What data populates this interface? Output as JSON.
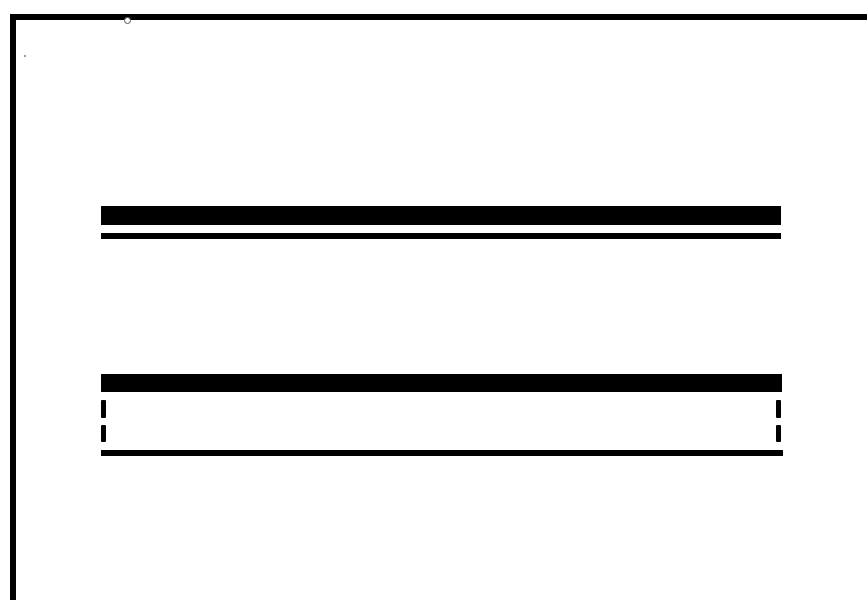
{
  "diagram": {
    "type": "line-symbol-legend",
    "colors": {
      "background": "#ffffff",
      "ink": "#000000"
    },
    "frame": {
      "top": {
        "x": 10,
        "y": 14,
        "w": 857,
        "h": 6
      },
      "left": {
        "x": 10,
        "y": 14,
        "w": 6,
        "h": 586
      }
    },
    "symbols": [
      {
        "name": "double-line-symbol",
        "parts": [
          {
            "role": "thick-bar",
            "x": 101,
            "y": 206,
            "w": 680,
            "h": 19
          },
          {
            "role": "thin-bar",
            "x": 101,
            "y": 233,
            "w": 680,
            "h": 6
          }
        ]
      },
      {
        "name": "box-with-dashed-sides-symbol",
        "parts": [
          {
            "role": "thick-bar",
            "x": 101,
            "y": 374,
            "w": 681,
            "h": 18
          },
          {
            "role": "left-dash-1",
            "x": 101,
            "y": 400,
            "w": 5,
            "h": 18
          },
          {
            "role": "left-dash-2",
            "x": 101,
            "y": 425,
            "w": 5,
            "h": 17
          },
          {
            "role": "right-dash-1",
            "x": 776,
            "y": 400,
            "w": 5,
            "h": 18
          },
          {
            "role": "right-dash-2",
            "x": 776,
            "y": 425,
            "w": 5,
            "h": 17
          },
          {
            "role": "thin-bar",
            "x": 101,
            "y": 450,
            "w": 682,
            "h": 6
          }
        ]
      }
    ]
  }
}
